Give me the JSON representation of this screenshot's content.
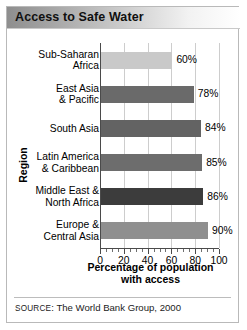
{
  "title": "Access to Safe Water",
  "source": {
    "prefix": "SOURCE",
    "rest": ": The World Bank Group, 2000"
  },
  "chart_data": {
    "type": "bar",
    "orientation": "horizontal",
    "title": "Access to Safe Water",
    "xlabel_line1": "Percentage of population",
    "xlabel_line2": "with access",
    "ylabel": "Region",
    "xlim": [
      0,
      100
    ],
    "xticks": [
      0,
      20,
      40,
      60,
      80,
      100
    ],
    "xtick_labels": [
      "0",
      "20",
      "40",
      "60",
      "80",
      "100"
    ],
    "minor_tick_step": 5,
    "grid": "vertical",
    "legend": "none",
    "categories": [
      "Sub-Saharan Africa",
      "East Asia & Pacific",
      "South Asia",
      "Latin America & Caribbean",
      "Middle East & North Africa",
      "Europe & Central Asia"
    ],
    "category_lines": [
      [
        "Sub-Saharan",
        "Africa"
      ],
      [
        "East Asia",
        "& Pacific"
      ],
      [
        "South Asia"
      ],
      [
        "Latin America",
        "& Caribbean"
      ],
      [
        "Middle East &",
        "North Africa"
      ],
      [
        "Europe &",
        "Central Asia"
      ]
    ],
    "values": [
      60,
      78,
      84,
      85,
      86,
      90
    ],
    "value_labels": [
      "60%",
      "78%",
      "84%",
      "85%",
      "86%",
      "90%"
    ],
    "bar_colors": [
      "#c9c9c9",
      "#6a6a6a",
      "#636363",
      "#6d6d6d",
      "#3c3c3c",
      "#8f8f8f"
    ]
  },
  "colors": {
    "title_bar_left": "#8e8e8e",
    "title_bar_right": "#ffffff",
    "axis": "#4a4a4a",
    "gridline": "#cdcdcd",
    "frame_border": "#b9b9b9"
  }
}
